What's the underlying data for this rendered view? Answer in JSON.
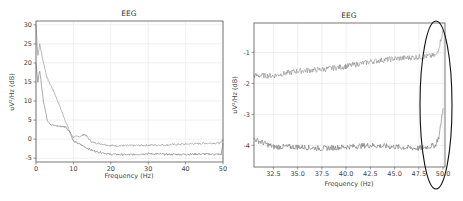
{
  "chart_data": [
    {
      "type": "line",
      "title": "EEG",
      "xlabel": "Frequency (Hz)",
      "ylabel": "uV²/Hz (dB)",
      "xlim": [
        0,
        50
      ],
      "ylim": [
        -6,
        31
      ],
      "xticks": [
        "0",
        "10",
        "20",
        "30",
        "40",
        "50"
      ],
      "yticks": [
        "-5",
        "0",
        "5",
        "10",
        "15",
        "20",
        "25",
        "30"
      ],
      "grid": true,
      "legend": null,
      "series": [
        {
          "name": "channel upper",
          "x": [
            0,
            0.5,
            1,
            2,
            3,
            5,
            7,
            9,
            10,
            12,
            13,
            15,
            20,
            25,
            30,
            35,
            40,
            45,
            49.5,
            50
          ],
          "values": [
            30,
            22,
            25,
            20,
            16,
            12,
            7,
            2,
            0.5,
            0.8,
            1.3,
            -0.8,
            -1.7,
            -1.7,
            -1.6,
            -1.5,
            -1.3,
            -1.1,
            -1.0,
            0
          ]
        },
        {
          "name": "channel lower",
          "x": [
            0,
            0.5,
            1,
            2,
            3,
            4,
            5,
            7,
            8,
            9,
            10,
            12,
            15,
            20,
            25,
            30,
            35,
            40,
            45,
            49.5,
            50
          ],
          "values": [
            20,
            15,
            18,
            10,
            5,
            3.8,
            3.5,
            3.3,
            3.2,
            2.0,
            -0.5,
            -1.5,
            -3.0,
            -4.0,
            -4.1,
            -3.8,
            -4.0,
            -4.0,
            -3.9,
            -4.0,
            -1.0
          ]
        }
      ]
    },
    {
      "type": "line",
      "title": "EEG",
      "xlabel": "Frequency (Hz)",
      "ylabel": "uV²/Hz (dB)",
      "xlim": [
        30.5,
        50.2
      ],
      "ylim": [
        -4.7,
        -0.05
      ],
      "xticks": [
        "32.5",
        "35.0",
        "37.5",
        "40.0",
        "42.5",
        "45.0",
        "47.5",
        "50.0"
      ],
      "yticks": [
        "-1",
        "-2",
        "-3",
        "-4"
      ],
      "grid": true,
      "annotations": [
        "ellipse highlighting 48.5–50 Hz region"
      ],
      "series": [
        {
          "name": "channel upper",
          "x": [
            30.5,
            32.5,
            35,
            37.5,
            40,
            42.5,
            45,
            47.5,
            49.3,
            49.6,
            50
          ],
          "values": [
            -1.75,
            -1.75,
            -1.6,
            -1.55,
            -1.45,
            -1.3,
            -1.2,
            -1.15,
            -1.1,
            -0.8,
            -0.3
          ]
        },
        {
          "name": "channel lower",
          "x": [
            30.5,
            32.5,
            35,
            37.5,
            40,
            42.5,
            45,
            47.5,
            49.2,
            49.6,
            50
          ],
          "values": [
            -3.8,
            -4.05,
            -4.05,
            -4.1,
            -4.05,
            -4.0,
            -4.05,
            -4.1,
            -4.0,
            -3.7,
            -2.8
          ]
        }
      ]
    }
  ],
  "colors": {
    "upper": "#8a8a8a",
    "lower": "#707070",
    "axis": "#555555",
    "grid": "#e6e6e6",
    "ellipse": "#111111"
  }
}
